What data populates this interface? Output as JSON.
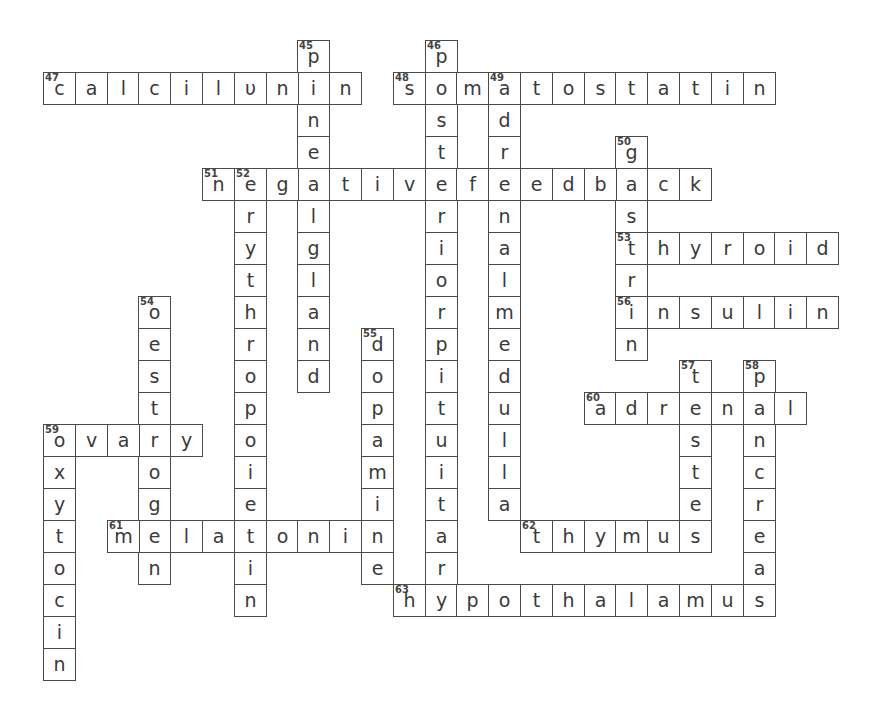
{
  "puzzle": {
    "type": "crossword",
    "grid": {
      "origin_x": 43,
      "origin_y": 40,
      "cell_w": 31.8,
      "cell_h": 32
    },
    "words": [
      {
        "number": 45,
        "direction": "down",
        "col": 8,
        "row": 0,
        "answer": "pinealgland"
      },
      {
        "number": 46,
        "direction": "down",
        "col": 12,
        "row": 0,
        "answer": "posteriorpituitary"
      },
      {
        "number": 47,
        "direction": "across",
        "col": 0,
        "row": 1,
        "answer": "calcitonin",
        "display": "calcilυnin"
      },
      {
        "number": 48,
        "direction": "across",
        "col": 11,
        "row": 1,
        "answer": "somatostatin"
      },
      {
        "number": 49,
        "direction": "down",
        "col": 14,
        "row": 1,
        "answer": "adrenalmedulla"
      },
      {
        "number": 50,
        "direction": "down",
        "col": 18,
        "row": 3,
        "answer": "gastrin"
      },
      {
        "number": 51,
        "direction": "across",
        "col": 5,
        "row": 4,
        "answer": "negativefeedback"
      },
      {
        "number": 52,
        "direction": "down",
        "col": 6,
        "row": 4,
        "answer": "erythropoietin"
      },
      {
        "number": 53,
        "direction": "across",
        "col": 18,
        "row": 6,
        "answer": "thyroid"
      },
      {
        "number": 54,
        "direction": "down",
        "col": 3,
        "row": 8,
        "answer": "oestrogen"
      },
      {
        "number": 55,
        "direction": "down",
        "col": 10,
        "row": 9,
        "answer": "dopamine"
      },
      {
        "number": 56,
        "direction": "across",
        "col": 18,
        "row": 8,
        "answer": "insulin"
      },
      {
        "number": 57,
        "direction": "down",
        "col": 20,
        "row": 10,
        "answer": "testes"
      },
      {
        "number": 58,
        "direction": "down",
        "col": 22,
        "row": 10,
        "answer": "pancreas"
      },
      {
        "number": 59,
        "direction": "across",
        "col": 0,
        "row": 12,
        "answer": "ovary"
      },
      {
        "number": 59,
        "direction": "down",
        "col": 0,
        "row": 12,
        "answer": "oxytocin",
        "hide_number": true
      },
      {
        "number": 60,
        "direction": "across",
        "col": 17,
        "row": 11,
        "answer": "adrenal"
      },
      {
        "number": 61,
        "direction": "across",
        "col": 2,
        "row": 15,
        "answer": "melatonin"
      },
      {
        "number": 62,
        "direction": "across",
        "col": 15,
        "row": 15,
        "answer": "thymus"
      },
      {
        "number": 63,
        "direction": "across",
        "col": 11,
        "row": 17,
        "answer": "hypothalamus"
      }
    ]
  },
  "colors": {
    "border": "#4a4a4a",
    "letter": "#3a3a3a",
    "background": "#ffffff"
  }
}
